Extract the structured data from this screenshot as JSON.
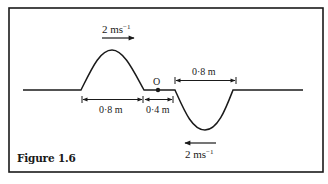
{
  "figure": {
    "caption": "Figure 1.6",
    "point_label": "O",
    "pulse_crest": {
      "velocity_label": "2 ms",
      "velocity_exponent": "−1",
      "direction": "right",
      "width_label": "0·8 m"
    },
    "gap": {
      "label": "0·4 m"
    },
    "pulse_trough": {
      "velocity_label": "2 ms",
      "velocity_exponent": "−1",
      "direction": "left",
      "width_label": "0·8 m"
    },
    "colors": {
      "line": "#1a1a1a",
      "background": "#ffffff"
    }
  }
}
